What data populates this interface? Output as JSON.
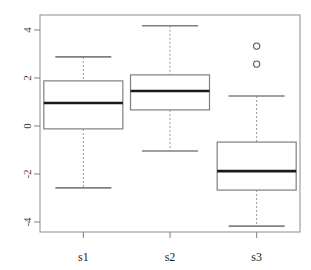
{
  "chart_data": {
    "type": "box",
    "title": "",
    "xlabel": "",
    "ylabel": "",
    "categories": [
      "s1",
      "s2",
      "s3"
    ],
    "ylim": [
      -4.55,
      4.55
    ],
    "yticks": [
      -4,
      -2,
      0,
      2,
      4
    ],
    "ytick_labels": [
      "-4",
      "-2",
      "0",
      "2",
      "4"
    ],
    "grid": false,
    "legend": "none",
    "y_axis_label_rotation_deg": -90,
    "boxes": [
      {
        "category": "s1",
        "whisker_low": -2.58,
        "q1": -0.12,
        "median": 0.96,
        "q3": 1.88,
        "whisker_high": 2.88,
        "outliers": []
      },
      {
        "category": "s2",
        "whisker_low": -1.04,
        "q1": 0.67,
        "median": 1.46,
        "q3": 2.13,
        "whisker_high": 4.18,
        "outliers": []
      },
      {
        "category": "s3",
        "whisker_low": -4.17,
        "q1": -2.67,
        "median": -1.88,
        "q3": -0.67,
        "whisker_high": 1.25,
        "outliers": [
          3.33,
          2.58
        ]
      }
    ],
    "colors": {
      "box_border": "#808080",
      "median": "#1a1a1a",
      "whisker": "#9a9a9a",
      "cap": "#808080",
      "outlier": "#555555",
      "axis": "#808080",
      "frame": "#8c8c8c",
      "background": "#ffffff",
      "tick_text": "#3a3a3a"
    }
  }
}
